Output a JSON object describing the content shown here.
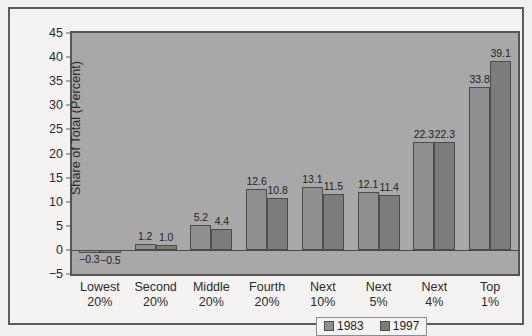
{
  "chart_data": {
    "type": "bar",
    "title": "",
    "xlabel": "",
    "ylabel": "Share of Total (Percent)",
    "ylim": [
      -5,
      45
    ],
    "yticks": [
      45,
      40,
      35,
      30,
      25,
      20,
      15,
      10,
      5,
      0,
      -5
    ],
    "ytick_labels": [
      "45",
      "40",
      "35",
      "30",
      "25",
      "20",
      "15",
      "10",
      "5",
      "0",
      "−5"
    ],
    "grid": false,
    "legend_position": "bottom-right",
    "categories": [
      "Lowest\n20%",
      "Second\n20%",
      "Middle\n20%",
      "Fourth\n20%",
      "Next\n10%",
      "Next\n5%",
      "Next\n4%",
      "Top\n1%"
    ],
    "category_lines": [
      [
        "Lowest",
        "20%"
      ],
      [
        "Second",
        "20%"
      ],
      [
        "Middle",
        "20%"
      ],
      [
        "Fourth",
        "20%"
      ],
      [
        "Next",
        "10%"
      ],
      [
        "Next",
        "5%"
      ],
      [
        "Next",
        "4%"
      ],
      [
        "Top",
        "1%"
      ]
    ],
    "series": [
      {
        "name": "1983",
        "color": "#8f8f8f",
        "values": [
          -0.3,
          1.2,
          5.2,
          12.6,
          13.1,
          12.1,
          22.3,
          33.8
        ],
        "labels": [
          "−0.3",
          "1.2",
          "5.2",
          "12.6",
          "13.1",
          "12.1",
          "22.3",
          "33.8"
        ]
      },
      {
        "name": "1997",
        "color": "#7c7c7c",
        "values": [
          -0.5,
          1.0,
          4.4,
          10.8,
          11.5,
          11.4,
          22.3,
          39.1
        ],
        "labels": [
          "−0.5",
          "1.0",
          "4.4",
          "10.8",
          "11.5",
          "11.4",
          "22.3",
          "39.1"
        ]
      }
    ]
  },
  "legend": {
    "items": [
      {
        "label": "1983",
        "color": "#8f8f8f"
      },
      {
        "label": "1997",
        "color": "#7c7c7c"
      }
    ]
  },
  "colors": {
    "page_background": "#f1f0ee",
    "frame_background": "#f4f3f1",
    "frame_border": "#5c5c5c",
    "plot_background": "#a8a8a8",
    "plot_border": "#555555",
    "axis_text": "#2b2b2b",
    "series_1983": "#8f8f8f",
    "series_1997": "#7c7c7c"
  }
}
